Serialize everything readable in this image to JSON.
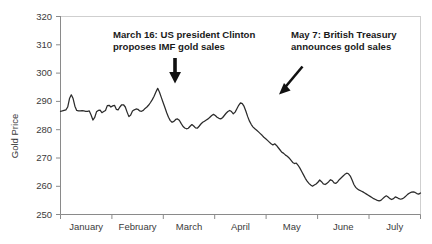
{
  "chart_data": {
    "type": "line",
    "title": "",
    "xlabel": "",
    "ylabel": "Gold Price",
    "ylim": [
      250,
      320
    ],
    "yticks": [
      250,
      260,
      270,
      280,
      290,
      300,
      310,
      320
    ],
    "ytick_labels": [
      "250",
      "260",
      "270",
      "280",
      "290",
      "300",
      "310",
      "320"
    ],
    "xtick_labels": [
      "January",
      "February",
      "March",
      "April",
      "May",
      "June",
      "July"
    ],
    "grid": false,
    "legend": null,
    "series": [
      {
        "name": "Gold Price",
        "color": "#2b2b2b",
        "x": [
          0.0,
          0.5,
          1.0,
          1.5,
          2.0,
          2.5,
          3.0,
          3.5,
          4.0,
          4.5,
          5.0,
          5.5,
          6.0,
          6.5,
          7.0,
          7.5,
          8.0,
          8.5,
          9.0,
          9.5,
          10.0,
          10.5,
          11.0,
          11.5,
          12.0,
          12.5,
          13.0,
          13.5,
          14.0,
          14.5,
          15.0,
          15.5,
          16.0,
          16.5,
          17.0,
          17.5,
          18.0,
          18.5,
          19.0,
          19.5,
          20.0,
          20.5,
          21.0,
          21.5,
          22.0,
          22.5,
          23.0,
          23.5,
          24.0,
          24.5,
          25.0,
          25.5,
          26.0,
          26.5,
          27.0,
          27.5,
          28.0,
          28.5,
          29.0,
          29.5,
          30.0,
          30.5,
          31.0,
          31.5,
          32.0,
          32.5,
          33.0,
          33.5,
          34.0,
          34.5,
          35.0,
          35.5,
          36.0,
          36.5,
          37.0,
          37.5,
          38.0,
          38.5,
          39.0,
          39.5,
          40.0,
          40.5,
          41.0,
          41.5,
          42.0,
          42.5,
          43.0,
          43.5,
          44.0,
          44.5,
          45.0,
          45.5,
          46.0,
          46.5,
          47.0,
          47.5,
          48.0,
          48.5,
          49.0,
          49.5,
          50.0,
          50.5,
          51.0,
          51.5,
          52.0,
          52.5,
          53.0,
          53.5,
          54.0,
          54.5,
          55.0,
          55.5,
          56.0,
          56.5,
          57.0,
          57.5,
          58.0,
          58.5,
          59.0,
          59.5,
          60.0,
          60.5,
          61.0,
          61.5,
          62.0,
          62.5,
          63.0,
          63.5,
          64.0,
          64.5,
          65.0,
          65.5,
          66.0,
          66.5,
          67.0,
          67.5,
          68.0,
          68.5,
          69.0,
          69.5,
          70.0,
          70.5,
          71.0,
          71.5,
          72.0,
          72.5,
          73.0,
          73.5,
          74.0,
          74.5,
          75.0,
          75.5,
          76.0,
          76.5,
          77.0,
          77.5,
          78.0,
          78.5,
          79.0,
          79.5,
          80.0,
          80.5,
          81.0,
          81.5,
          82.0,
          82.5,
          83.0,
          83.5,
          84.0,
          84.5,
          85.0,
          85.5,
          86.0,
          86.5,
          87.0,
          87.5,
          88.0,
          88.5,
          89.0,
          89.5,
          90.0,
          90.5,
          91.0,
          91.5,
          92.0,
          92.5,
          93.0,
          93.5,
          94.0,
          94.5,
          95.0,
          95.5,
          96.0,
          96.5,
          97.0,
          97.5,
          98.0,
          98.5,
          99.0,
          99.5,
          100.0
        ],
        "values": [
          286.5,
          286.6,
          286.8,
          287.0,
          288.0,
          291.0,
          292.3,
          291.0,
          288.3,
          286.8,
          286.6,
          286.6,
          286.7,
          286.6,
          286.5,
          286.5,
          286.6,
          285.2,
          283.4,
          284.3,
          286.3,
          286.8,
          286.9,
          286.0,
          286.4,
          286.8,
          288.5,
          288.6,
          288.0,
          288.4,
          288.6,
          287.2,
          287.0,
          288.0,
          288.8,
          288.8,
          288.0,
          286.2,
          284.6,
          285.2,
          286.6,
          287.0,
          287.3,
          287.2,
          286.6,
          286.5,
          286.8,
          287.5,
          288.0,
          288.7,
          289.6,
          290.6,
          291.8,
          293.3,
          294.6,
          293.2,
          291.4,
          289.6,
          287.8,
          286.0,
          284.4,
          283.2,
          282.6,
          282.9,
          283.6,
          283.8,
          283.3,
          282.2,
          281.2,
          280.6,
          280.3,
          280.5,
          281.2,
          281.8,
          281.3,
          280.6,
          280.5,
          281.2,
          282.0,
          282.6,
          283.0,
          283.4,
          283.8,
          284.4,
          285.0,
          285.4,
          285.0,
          284.4,
          284.0,
          283.8,
          284.2,
          285.0,
          285.8,
          286.4,
          286.8,
          286.4,
          285.6,
          286.2,
          287.4,
          288.6,
          289.5,
          289.2,
          288.2,
          286.5,
          284.6,
          283.0,
          281.8,
          280.9,
          280.3,
          279.8,
          279.2,
          278.6,
          278.0,
          277.3,
          276.8,
          276.2,
          275.6,
          275.0,
          274.6,
          275.0,
          274.4,
          273.6,
          272.8,
          272.0,
          271.6,
          271.0,
          270.6,
          270.0,
          269.2,
          268.4,
          268.0,
          268.2,
          267.4,
          266.4,
          265.2,
          264.0,
          262.8,
          261.8,
          261.0,
          260.4,
          260.0,
          260.4,
          260.8,
          261.4,
          262.2,
          261.6,
          260.8,
          260.6,
          261.0,
          261.6,
          262.3,
          262.0,
          261.2,
          261.0,
          261.6,
          262.4,
          263.0,
          263.6,
          264.2,
          264.6,
          264.4,
          263.6,
          262.2,
          260.6,
          259.6,
          259.0,
          258.6,
          258.3,
          258.0,
          257.6,
          257.2,
          256.8,
          256.4,
          256.0,
          255.6,
          255.3,
          255.0,
          254.8,
          255.0,
          255.6,
          256.2,
          256.6,
          256.2,
          255.6,
          255.3,
          255.6,
          256.2,
          256.0,
          255.6,
          255.4,
          255.6,
          256.0,
          256.6,
          257.2,
          257.6,
          257.9,
          258.0,
          257.8,
          257.4,
          257.2,
          257.6
        ]
      }
    ],
    "annotations": [
      {
        "id": "clinton-annotation",
        "line1": "March 16: US president Clinton",
        "line2": "proposes IMF gold sales",
        "arrow": "down-arrow"
      },
      {
        "id": "treasury-annotation",
        "line1": "May 7: British Treasury",
        "line2": "announces gold sales",
        "arrow": "diagonal-arrow"
      }
    ],
    "colors": {
      "series": "#2b2b2b",
      "axis": "#8a8a8a",
      "text": "#3b3b3b",
      "annotation": "#1a1a1a",
      "background": "#ffffff"
    }
  }
}
